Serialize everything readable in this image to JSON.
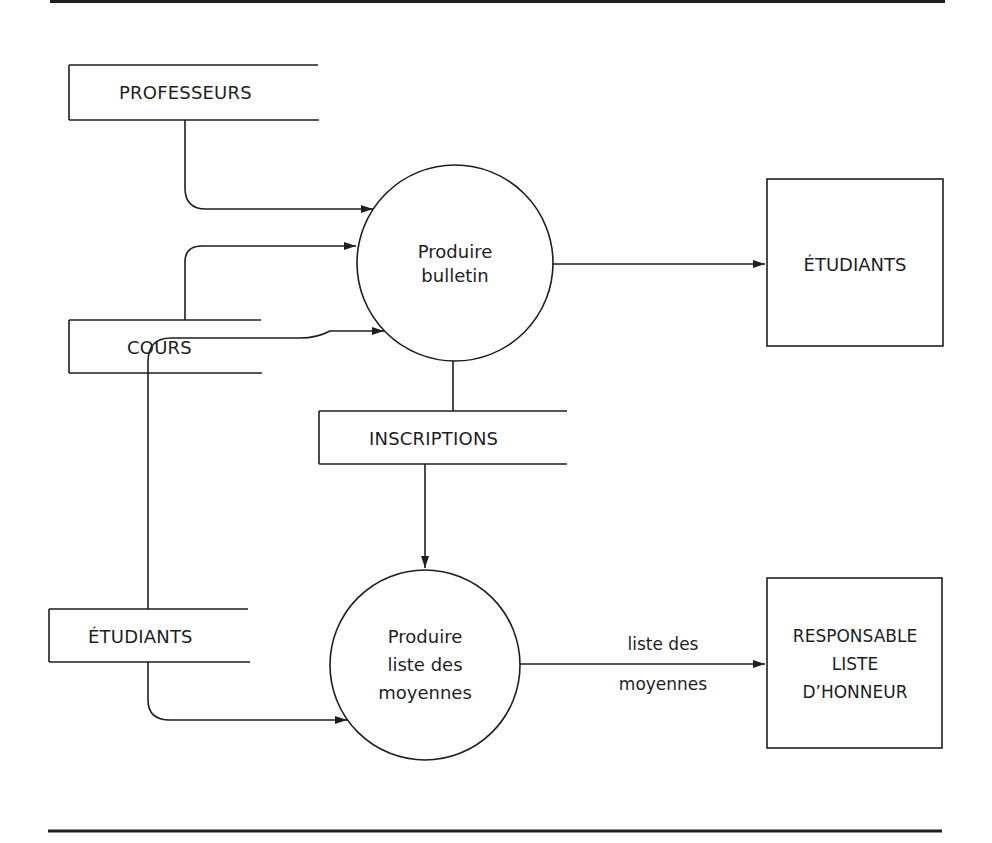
{
  "diagram": {
    "type": "data-flow-diagram",
    "stroke_color": "#1e1e1e",
    "background": "#ffffff",
    "data_stores": [
      {
        "id": "professeurs",
        "label": "PROFESSEURS"
      },
      {
        "id": "cours",
        "label": "COURS"
      },
      {
        "id": "inscriptions",
        "label": "INSCRIPTIONS"
      },
      {
        "id": "etudiants_store",
        "label": "ÉTUDIANTS"
      }
    ],
    "processes": [
      {
        "id": "produire_bulletin",
        "lines": [
          "Produire",
          "bulletin"
        ]
      },
      {
        "id": "produire_liste",
        "lines": [
          "Produire",
          "liste des",
          "moyennes"
        ]
      }
    ],
    "external_entities": [
      {
        "id": "etudiants_entity",
        "lines": [
          "ÉTUDIANTS"
        ]
      },
      {
        "id": "responsable",
        "lines": [
          "RESPONSABLE",
          "LISTE",
          "D’HONNEUR"
        ]
      }
    ],
    "flows": [
      {
        "from": "professeurs",
        "to": "produire_bulletin",
        "label": ""
      },
      {
        "from": "cours",
        "to": "produire_bulletin",
        "label": ""
      },
      {
        "from": "etudiants_store",
        "to": "produire_bulletin",
        "label": ""
      },
      {
        "from": "produire_bulletin",
        "to": "etudiants_entity",
        "label": ""
      },
      {
        "from": "produire_bulletin",
        "to": "inscriptions",
        "label": ""
      },
      {
        "from": "inscriptions",
        "to": "produire_liste",
        "label": ""
      },
      {
        "from": "etudiants_store",
        "to": "produire_liste",
        "label": ""
      },
      {
        "from": "produire_liste",
        "to": "responsable",
        "label_lines": [
          "liste des",
          "moyennes"
        ]
      }
    ]
  }
}
